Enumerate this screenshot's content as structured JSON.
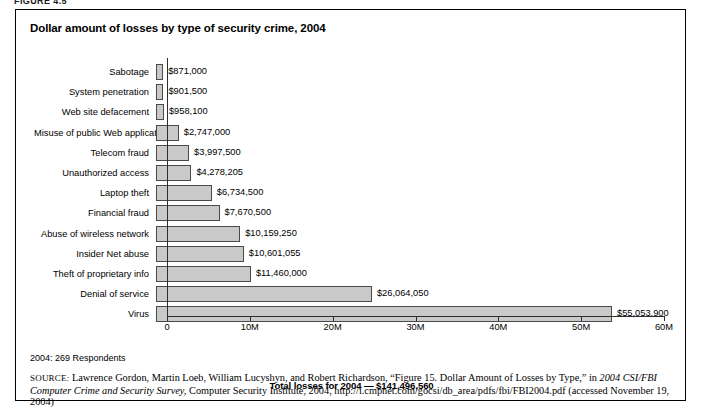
{
  "page": {
    "figure_number": "FIGURE 4.5"
  },
  "figure": {
    "title": "Dollar amount of losses by type of security crime, 2004",
    "respondents_note": "2004: 269 Respondents"
  },
  "source": {
    "label": "SOURCE:",
    "text_part1": " Lawrence Gordon, Martin Loeb, William Lucyshyn, and Robert Richardson, “Figure 15. Dollar Amount of Losses by Type,” in ",
    "italic1": "2004 CSI/FBI Computer Crime and Security Survey,",
    "text_part2": " Computer Security Institute, 2004, http://i.cmpnet.com/gocsi/db_area/pdfs/fbi/FBI2004.pdf (accessed November 19, 2004)"
  },
  "chart_data": {
    "type": "bar",
    "orientation": "horizontal",
    "title": "Dollar amount of losses by type of security crime, 2004",
    "xlabel": "Total losses for 2004 — $141,496,560",
    "ylabel": "",
    "xlim": [
      0,
      60000000
    ],
    "grid": false,
    "legend": null,
    "xticks": [
      0,
      10000000,
      20000000,
      30000000,
      40000000,
      50000000,
      60000000
    ],
    "xticklabels": [
      "0",
      "10M",
      "20M",
      "30M",
      "40M",
      "50M",
      "60M"
    ],
    "categories": [
      "Sabotage",
      "System penetration",
      "Web site defacement",
      "Misuse of public Web application",
      "Telecom fraud",
      "Unauthorized access",
      "Laptop theft",
      "Financial fraud",
      "Abuse of wireless network",
      "Insider Net abuse",
      "Theft of proprietary info",
      "Denial of service",
      "Virus"
    ],
    "values": [
      871000,
      901500,
      958100,
      2747000,
      3997500,
      4278205,
      6734500,
      7670500,
      10159250,
      10601055,
      11460000,
      26064050,
      55053900
    ],
    "value_labels": [
      "$871,000",
      "$901,500",
      "$958,100",
      "$2,747,000",
      "$3,997,500",
      "$4,278,205",
      "$6,734,500",
      "$7,670,500",
      "$10,159,250",
      "$10,601,055",
      "$11,460,000",
      "$26,064,050",
      "$55,053,900"
    ],
    "total_label": "Total losses for 2004 — $141,496,560",
    "total_value": 141496560,
    "bar_fill_color": "#c9c9c9",
    "bar_edge_color": "#4a4a4a"
  }
}
